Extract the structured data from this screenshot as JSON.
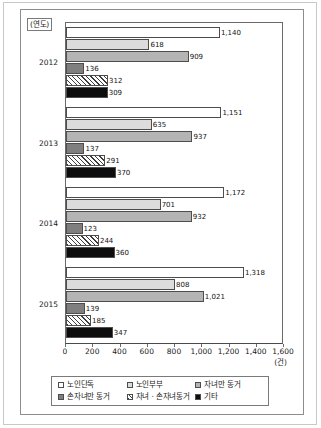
{
  "axis": {
    "year_caption": "(연도)",
    "unit_label": "(건)"
  },
  "chart_data": {
    "type": "bar",
    "orientation": "horizontal",
    "title": "",
    "xlabel": "(건)",
    "ylabel": "(연도)",
    "xlim": [
      0,
      1600
    ],
    "xticks": [
      0,
      200,
      400,
      600,
      800,
      1000,
      1200,
      1400,
      1600
    ],
    "xtick_labels": [
      "0",
      "200",
      "400",
      "600",
      "800",
      "1,000",
      "1,200",
      "1,400",
      "1,600"
    ],
    "grid": false,
    "legend_position": "bottom",
    "categories": [
      "2012",
      "2013",
      "2014",
      "2015"
    ],
    "series": [
      {
        "name": "노인단독",
        "values": [
          1140,
          1151,
          1172,
          1318
        ],
        "labels": [
          "1,140",
          "1,151",
          "1,172",
          "1,318"
        ],
        "fill": "white"
      },
      {
        "name": "노인부부",
        "values": [
          618,
          635,
          701,
          808
        ],
        "labels": [
          "618",
          "635",
          "701",
          "808"
        ],
        "fill": "light-gray"
      },
      {
        "name": "자녀만 동거",
        "values": [
          909,
          937,
          932,
          1021
        ],
        "labels": [
          "909",
          "937",
          "932",
          "1,021"
        ],
        "fill": "medium-gray"
      },
      {
        "name": "손자녀만 동거",
        "values": [
          136,
          137,
          123,
          139
        ],
        "labels": [
          "136",
          "137",
          "123",
          "139"
        ],
        "fill": "dark-gray"
      },
      {
        "name": "자녀 · 손자녀동거",
        "values": [
          312,
          291,
          244,
          185
        ],
        "labels": [
          "312",
          "291",
          "244",
          "185"
        ],
        "fill": "hatched"
      },
      {
        "name": "기타",
        "values": [
          309,
          370,
          360,
          347
        ],
        "labels": [
          "309",
          "370",
          "360",
          "347"
        ],
        "fill": "black"
      }
    ]
  },
  "legend": {
    "items": [
      {
        "label": "노인단독",
        "swatch": "white"
      },
      {
        "label": "노인부부",
        "swatch": "light-gray"
      },
      {
        "label": "자녀만 동거",
        "swatch": "medium-gray"
      },
      {
        "label": "손자녀만 동거",
        "swatch": "dark-gray"
      },
      {
        "label": "자녀 · 손자녀동거",
        "swatch": "hatched"
      },
      {
        "label": "기타",
        "swatch": "black"
      }
    ]
  }
}
